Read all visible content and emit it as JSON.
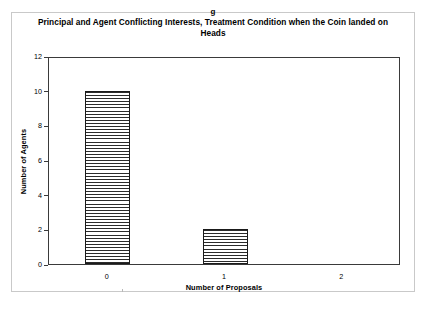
{
  "figure": {
    "panel_letter": "g",
    "title": "Principal and Agent Conflicting Interests, Treatment Condition when the Coin landed on Heads"
  },
  "chart_data": {
    "type": "bar",
    "title": "Principal and Agent Conflicting Interests, Treatment Condition when the Coin landed on Heads",
    "panel_label": "g",
    "categories": [
      "0",
      "1",
      "2"
    ],
    "values": [
      10,
      2,
      0
    ],
    "xlabel": "Number of Proposals",
    "ylabel": "Number of Agents",
    "ylim": [
      0,
      12
    ],
    "yticks": [
      0,
      2,
      4,
      6,
      8,
      10,
      12
    ],
    "ytick_labels": [
      "0",
      "2",
      "4",
      "6",
      "8",
      "10",
      "12"
    ],
    "grid": false,
    "legend": null,
    "bar_style": "horizontal-line-hatch",
    "colors": {
      "bar_fill": "#ffffff",
      "bar_hatch": "#2b2b2b",
      "bar_edge": "#1a1a1a",
      "axis": "#3a3a3a",
      "frame": "#c9c9c9",
      "text": "#000000"
    }
  }
}
